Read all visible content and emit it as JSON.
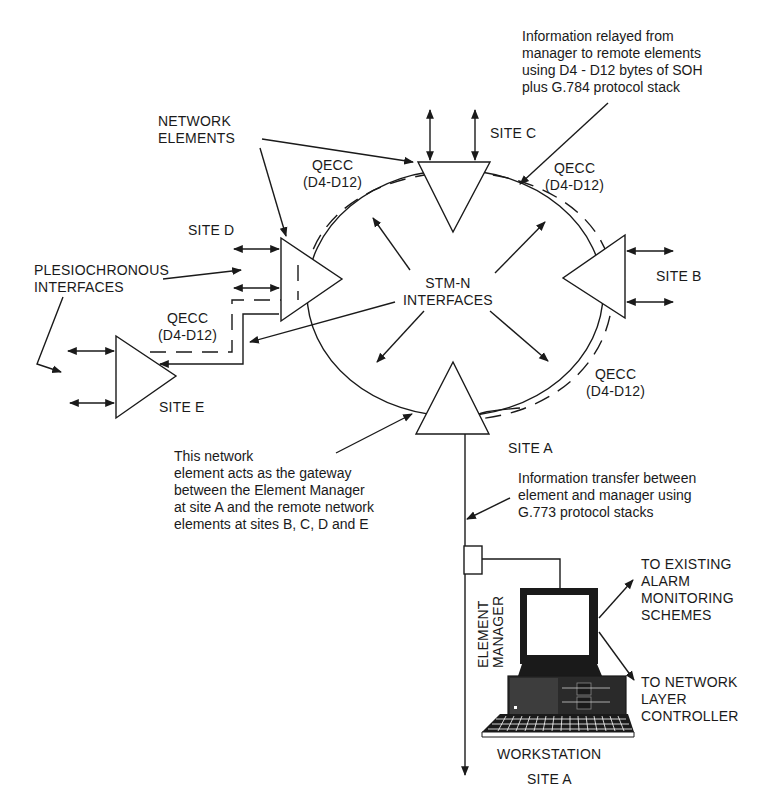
{
  "diagram": {
    "title": "",
    "sites": {
      "a": {
        "label": "SITE A"
      },
      "b": {
        "label": "SITE B"
      },
      "c": {
        "label": "SITE C"
      },
      "d": {
        "label": "SITE D"
      },
      "e": {
        "label": "SITE E"
      }
    },
    "labels": {
      "network_elements": "NETWORK\nELEMENTS",
      "plesiochronous": "PLESIOCHRONOUS\nINTERFACES",
      "stm_n": "STM-N\nINTERFACES",
      "qecc_top_left": "QECC\n(D4-D12)",
      "qecc_top_right": "QECC\n(D4-D12)",
      "qecc_left": "QECC\n(D4-D12)",
      "qecc_bottom_right": "QECC\n(D4-D12)",
      "info_relayed": "Information relayed from\nmanager to remote elements\nusing D4 - D12 bytes of SOH\nplus G.784 protocol stack",
      "gateway_note": "This network\nelement acts as the gateway\nbetween the Element Manager\nat site A and the remote network\nelements at sites B, C, D and E",
      "info_transfer": "Information transfer between\nelement and manager using\nG.773 protocol stacks",
      "element_manager": "ELEMENT\nMANAGER",
      "to_alarm": "TO EXISTING\nALARM\nMONITORING\nSCHEMES",
      "to_network_layer": "TO NETWORK\nLAYER\nCONTROLLER",
      "workstation": "WORKSTATION",
      "workstation_site": "SITE A"
    },
    "colors": {
      "ink": "#1a1a1a",
      "background": "#ffffff"
    }
  }
}
